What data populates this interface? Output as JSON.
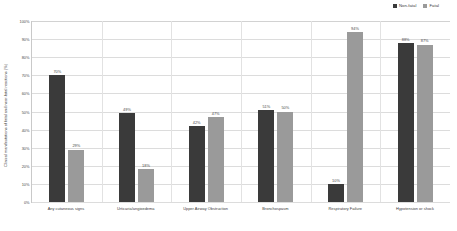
{
  "chart_data": {
    "type": "bar",
    "title": "",
    "xlabel": "",
    "ylabel": "Clinical manifestations of fatal and near-fatal reactions (%)",
    "ylim": [
      0,
      100
    ],
    "ytick_labels": [
      "100%",
      "90%",
      "80%",
      "70%",
      "60%",
      "50%",
      "40%",
      "30%",
      "20%",
      "10%",
      "0%"
    ],
    "ytick_values": [
      100,
      90,
      80,
      70,
      60,
      50,
      40,
      30,
      20,
      10,
      0
    ],
    "grid": true,
    "legend_position": "top-right",
    "categories": [
      "Any cutaneous signs",
      "Urticaria/angioedema",
      "Upper Airway Obstruction",
      "Bronchospasm",
      "Respiratory Failure",
      "Hypotension or shock"
    ],
    "series": [
      {
        "name": "Non-fatal",
        "color": "#3a3a3a",
        "values": [
          70,
          49,
          42,
          51,
          10,
          88
        ],
        "labels": [
          "70%",
          "49%",
          "42%",
          "51%",
          "10%",
          "88%"
        ]
      },
      {
        "name": "Fatal",
        "color": "#9a9a9a",
        "values": [
          29,
          18,
          47,
          50,
          94,
          87
        ],
        "labels": [
          "29%",
          "18%",
          "47%",
          "50%",
          "94%",
          "87%"
        ]
      }
    ]
  }
}
